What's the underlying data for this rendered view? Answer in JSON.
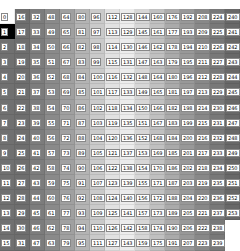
{
  "grid": {
    "rows": 16,
    "cols": 16,
    "formula": "value = row + 16 * col",
    "column_shades": [
      "#707070",
      "#6e6e6e",
      "#7c7c7c",
      "#8a8a8a",
      "#a0a0a0",
      "#b4b4b4",
      "#cacaca",
      "#e2e2e2",
      "#ececec",
      "#d6d6d6",
      "#c0c0c0",
      "#aaaaaa",
      "#989898",
      "#888888",
      "#787878",
      "#686868"
    ],
    "special_cells": [
      {
        "row": 0,
        "col": 0,
        "shade": "#ffffff"
      },
      {
        "row": 1,
        "col": 0,
        "shade": "#000000"
      }
    ],
    "blank_cells": [
      {
        "row": 14,
        "col": 15
      },
      {
        "row": 15,
        "col": 15
      }
    ]
  }
}
